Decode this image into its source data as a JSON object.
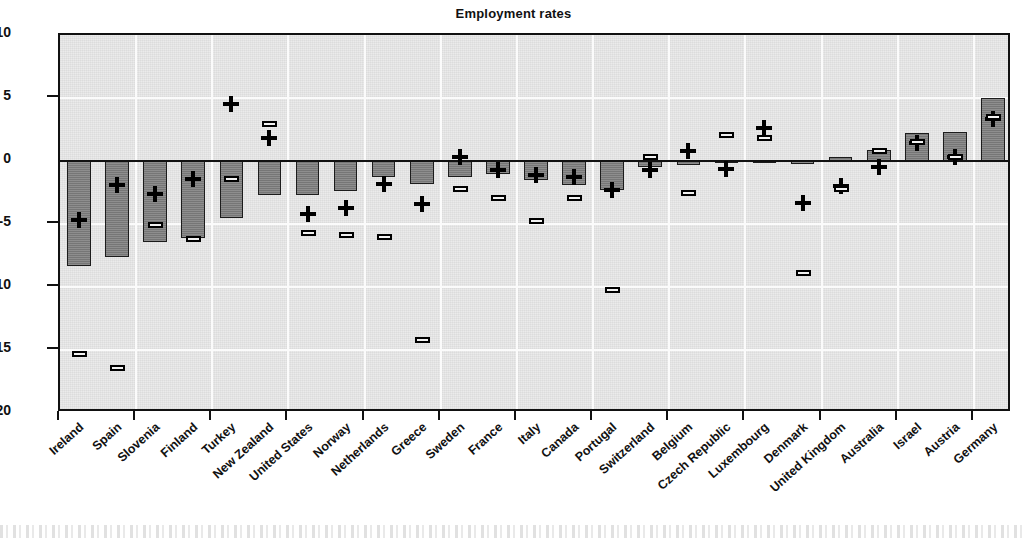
{
  "chart_data": {
    "type": "bar",
    "title": "Employment rates",
    "xlabel": "",
    "ylabel": "",
    "ylim": [
      -20,
      10
    ],
    "ytick_labels": [
      "10",
      "5",
      "0",
      "-5",
      "-10",
      "-15",
      "-20"
    ],
    "yticks": [
      10,
      5,
      0,
      -5,
      -10,
      -15,
      -20
    ],
    "grid": true,
    "legend_position": "none",
    "categories": [
      "Ireland",
      "Spain",
      "Slovenia",
      "Finland",
      "Turkey",
      "New Zealand",
      "United States",
      "Norway",
      "Netherlands",
      "Greece",
      "Sweden",
      "France",
      "Italy",
      "Canada",
      "Portugal",
      "Switzerland",
      "Belgium",
      "Czech Republic",
      "Luxembourg",
      "Denmark",
      "United Kingdom",
      "Australia",
      "Israel",
      "Austria",
      "Germany"
    ],
    "series": [
      {
        "name": "bars",
        "marker": "bar",
        "values": [
          -8.3,
          -7.6,
          -6.4,
          -6.1,
          -4.5,
          -2.7,
          -2.7,
          -2.4,
          -1.3,
          -1.8,
          -1.3,
          -1.0,
          -1.5,
          -1.9,
          -2.3,
          -0.5,
          -0.3,
          -0.1,
          -0.1,
          -0.2,
          0.3,
          0.9,
          2.2,
          2.3,
          5.0
        ]
      },
      {
        "name": "plus-markers",
        "marker": "plus",
        "values": [
          -4.7,
          -1.9,
          -2.6,
          -1.4,
          4.5,
          1.8,
          -4.2,
          -3.7,
          -1.8,
          -3.4,
          0.35,
          -0.75,
          -1.1,
          -1.3,
          -2.3,
          -0.7,
          0.8,
          -0.6,
          2.6,
          -3.3,
          -2.0,
          -0.5,
          1.4,
          0.3,
          3.3
        ]
      },
      {
        "name": "dash-markers",
        "marker": "dash",
        "values": [
          -15.3,
          -16.4,
          -5.1,
          -6.2,
          -1.4,
          2.9,
          -5.7,
          -5.9,
          -6.0,
          -14.2,
          -2.2,
          -2.9,
          -4.8,
          -2.9,
          -10.2,
          0.3,
          -2.5,
          2.1,
          1.8,
          -8.9,
          -2.2,
          0.8,
          1.5,
          0.3,
          3.5
        ]
      }
    ]
  },
  "meta": {
    "axis_color": "#111111",
    "bar_fill": "#7d7d7d",
    "bar_stroke": "#1c1c1c",
    "plot_background": "#ebebeb",
    "page_background": "#ffffff"
  }
}
